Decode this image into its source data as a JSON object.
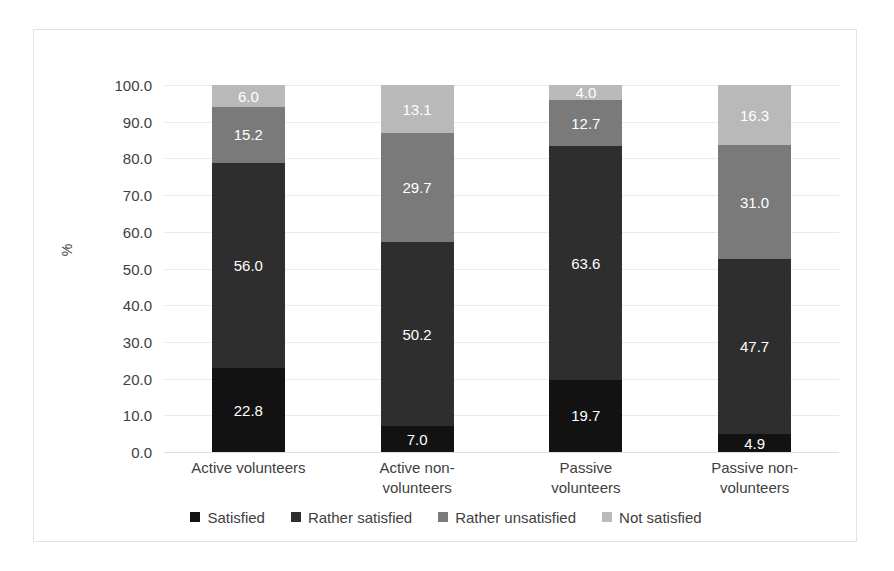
{
  "chart_data": {
    "type": "bar",
    "subtype": "stacked-bar-100-percent",
    "title": "",
    "xlabel": "",
    "ylabel": "%",
    "ylim": [
      0,
      100
    ],
    "ytick_step": 10,
    "ytick_labels": [
      "0.0",
      "10.0",
      "20.0",
      "30.0",
      "40.0",
      "50.0",
      "60.0",
      "70.0",
      "80.0",
      "90.0",
      "100.0"
    ],
    "grid": true,
    "legend_position": "bottom",
    "categories": [
      "Active volunteers",
      "Active non-volunteers",
      "Passive volunteers",
      "Passive non-volunteers"
    ],
    "category_lines": [
      [
        "Active volunteers"
      ],
      [
        "Active non-",
        "volunteers"
      ],
      [
        "Passive volunteers"
      ],
      [
        "Passive non-",
        "volunteers"
      ]
    ],
    "series": [
      {
        "name": "Satisfied",
        "color": "#121212",
        "values": [
          22.8,
          7.0,
          19.7,
          4.9
        ],
        "labels": [
          "22.8",
          "7.0",
          "19.7",
          "4.9"
        ]
      },
      {
        "name": "Rather satisfied",
        "color": "#2e2e2e",
        "values": [
          56.0,
          50.2,
          63.6,
          47.7
        ],
        "labels": [
          "56.0",
          "50.2",
          "63.6",
          "47.7"
        ]
      },
      {
        "name": "Rather unsatisfied",
        "color": "#7a7a7a",
        "values": [
          15.2,
          29.7,
          12.7,
          31.0
        ],
        "labels": [
          "15.2",
          "29.7",
          "12.7",
          "31.0"
        ]
      },
      {
        "name": "Not satisfied",
        "color": "#b9b9b9",
        "values": [
          6.0,
          13.1,
          4.0,
          16.3
        ],
        "labels": [
          "6.0",
          "13.1",
          "4.0",
          "16.3"
        ]
      }
    ]
  },
  "colors": {
    "background": "#ffffff",
    "frame_border": "#e3e3e3",
    "gridline": "#eceaea",
    "text": "#404040",
    "value_label": "#ffffff"
  }
}
